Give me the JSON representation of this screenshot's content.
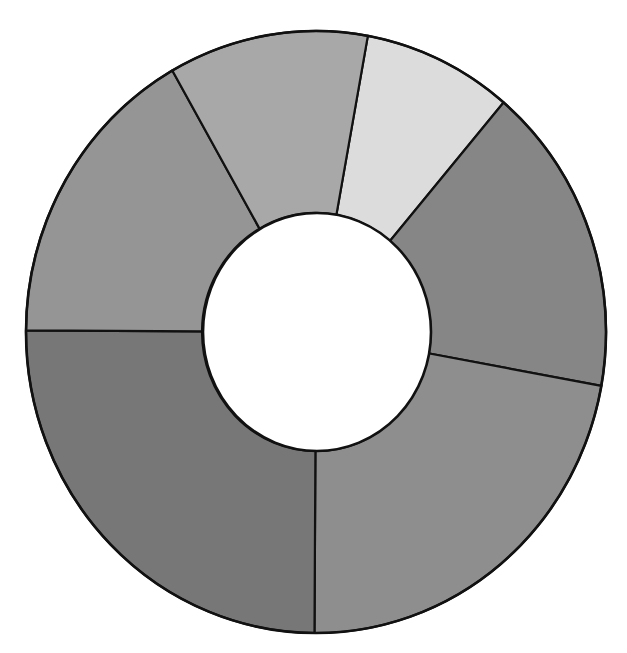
{
  "chart_data": {
    "type": "pie",
    "variant": "donut",
    "title": "",
    "categories": [
      "Segment A",
      "Segment B",
      "Segment C",
      "Segment D",
      "Segment E",
      "Segment F"
    ],
    "values": [
      3,
      6,
      8,
      9,
      6,
      4
    ],
    "percentages": [
      8.3,
      16.7,
      22.2,
      25.0,
      16.7,
      11.1
    ],
    "colors": [
      "#dcdcdc",
      "#868686",
      "#8e8e8e",
      "#777777",
      "#959595",
      "#a8a8a8"
    ],
    "start_angle_deg_clockwise_from_top": 10.3,
    "direction": "clockwise",
    "legend": "none",
    "labels_shown": false,
    "grid": false
  },
  "geometry": {
    "cx": 316,
    "cy": 332,
    "outer_rx": 290,
    "outer_ry": 301,
    "inner_rx": 114,
    "inner_ry": 119
  }
}
